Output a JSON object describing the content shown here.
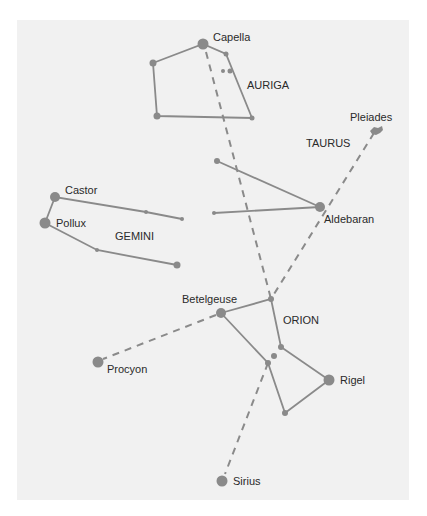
{
  "diagram": {
    "colors": {
      "background": "#f1f1f1",
      "line": "#8a8a8a",
      "star": "#8a8a8a",
      "text": "#2a2a2a"
    },
    "constellation_labels": {
      "auriga": "AURIGA",
      "taurus": "TAURUS",
      "gemini": "GEMINI",
      "orion": "ORION"
    },
    "star_labels": {
      "capella": "Capella",
      "pleiades": "Pleiades",
      "aldebaran": "Aldebaran",
      "castor": "Castor",
      "pollux": "Pollux",
      "betelgeuse": "Betelgeuse",
      "procyon": "Procyon",
      "rigel": "Rigel",
      "sirius": "Sirius"
    },
    "stars": [
      {
        "id": "capella",
        "x": 203,
        "y": 44,
        "r": 5.5
      },
      {
        "id": "auriga-ne",
        "x": 226,
        "y": 54,
        "r": 2.5
      },
      {
        "id": "auriga-w",
        "x": 153,
        "y": 63,
        "r": 3.5
      },
      {
        "id": "auriga-sw",
        "x": 157,
        "y": 116,
        "r": 3.5
      },
      {
        "id": "auriga-se",
        "x": 252,
        "y": 118,
        "r": 2.5
      },
      {
        "id": "auriga-kid1",
        "x": 223,
        "y": 71,
        "r": 2
      },
      {
        "id": "auriga-kid2",
        "x": 230,
        "y": 71,
        "r": 2.5
      },
      {
        "id": "aldebaran",
        "x": 320,
        "y": 207,
        "r": 5
      },
      {
        "id": "taurus-n",
        "x": 217,
        "y": 161,
        "r": 3
      },
      {
        "id": "taurus-w",
        "x": 214,
        "y": 213,
        "r": 2
      },
      {
        "id": "castor",
        "x": 55,
        "y": 197,
        "r": 5
      },
      {
        "id": "gemini-c2",
        "x": 146,
        "y": 212,
        "r": 2
      },
      {
        "id": "gemini-c3",
        "x": 182,
        "y": 219,
        "r": 2
      },
      {
        "id": "pollux",
        "x": 45,
        "y": 223,
        "r": 5.5
      },
      {
        "id": "gemini-p2",
        "x": 97,
        "y": 250,
        "r": 2
      },
      {
        "id": "gemini-p3",
        "x": 177,
        "y": 265,
        "r": 3.5
      },
      {
        "id": "betelgeuse",
        "x": 221,
        "y": 313,
        "r": 5
      },
      {
        "id": "bellatrix",
        "x": 271,
        "y": 299,
        "r": 3
      },
      {
        "id": "mintaka",
        "x": 281,
        "y": 347,
        "r": 3
      },
      {
        "id": "alnilam",
        "x": 274,
        "y": 356,
        "r": 3
      },
      {
        "id": "alnitak",
        "x": 268,
        "y": 363,
        "r": 3
      },
      {
        "id": "rigel",
        "x": 329,
        "y": 380,
        "r": 5.5
      },
      {
        "id": "saiph",
        "x": 285,
        "y": 413,
        "r": 3
      },
      {
        "id": "procyon",
        "x": 98,
        "y": 362,
        "r": 5.5
      },
      {
        "id": "sirius",
        "x": 222,
        "y": 481,
        "r": 5.5
      }
    ]
  }
}
